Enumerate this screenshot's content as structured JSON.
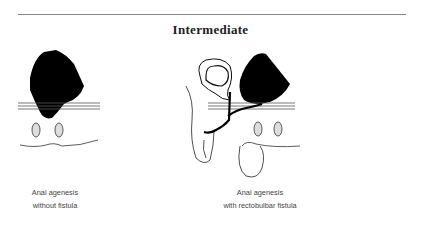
{
  "title": "Intermediate",
  "figures": [
    {
      "id": "left",
      "caption_line1": "Anal agenesis",
      "caption_line2": "without fistula"
    },
    {
      "id": "right",
      "caption_line1": "Anal agenesis",
      "caption_line2": "with rectobulbar fistula"
    }
  ]
}
